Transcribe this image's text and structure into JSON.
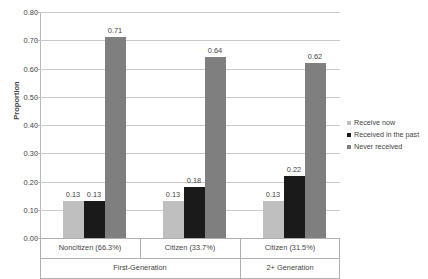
{
  "chart_data": {
    "type": "bar",
    "title": "",
    "xlabel": "",
    "ylabel": "Proportion",
    "ylim": [
      0.0,
      0.8
    ],
    "ytick_labels": [
      "0.00",
      "0.10",
      "0.20",
      "0.30",
      "0.40",
      "0.50",
      "0.60",
      "0.70",
      "0.80"
    ],
    "ytick_values": [
      0.0,
      0.1,
      0.2,
      0.3,
      0.4,
      0.5,
      0.6,
      0.7,
      0.8
    ],
    "grid": true,
    "legend_position": "right",
    "categories": [
      "Noncitizen (66.3%)",
      "Citizen (33.7%)",
      "Citizen (31.5%)"
    ],
    "group_headers": [
      {
        "label": "First-Generation",
        "spans": [
          "Noncitizen (66.3%)",
          "Citizen (33.7%)"
        ]
      },
      {
        "label": "2+ Generation",
        "spans": [
          "Citizen (31.5%)"
        ]
      }
    ],
    "series": [
      {
        "name": "Receive now",
        "color": "#bfbfbf",
        "values": [
          0.13,
          0.13,
          0.13
        ],
        "value_labels": [
          "0.13",
          "0.13",
          "0.13"
        ]
      },
      {
        "name": "Received in the past",
        "color": "#1a1a1a",
        "values": [
          0.13,
          0.18,
          0.22
        ],
        "value_labels": [
          "0.13",
          "0.18",
          "0.22"
        ]
      },
      {
        "name": "Never received",
        "color": "#7f7f7f",
        "values": [
          0.71,
          0.64,
          0.62
        ],
        "value_labels": [
          "0.71",
          "0.64",
          "0.62"
        ]
      }
    ],
    "legend": [
      {
        "label": "Receive now",
        "color": "#bfbfbf"
      },
      {
        "label": "Received in the past",
        "color": "#1a1a1a"
      },
      {
        "label": "Never received",
        "color": "#7f7f7f"
      }
    ]
  }
}
